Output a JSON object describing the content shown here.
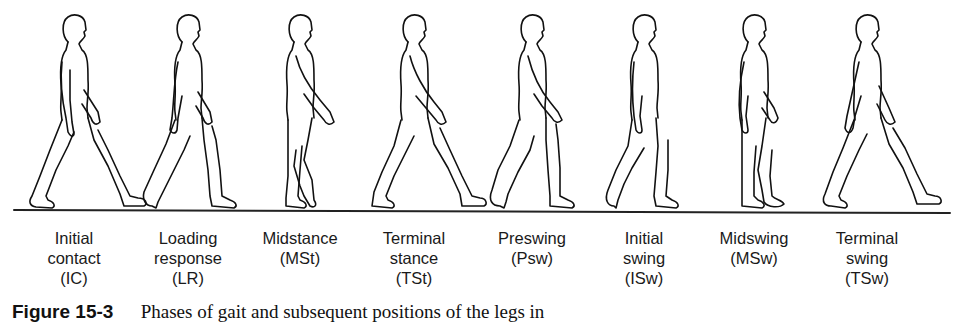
{
  "figure": {
    "number": "Figure 15-3",
    "caption": "Phases of gait and subsequent positions of the legs in",
    "ground_line": {
      "x1": 14,
      "y1": 210,
      "x2": 950,
      "y2": 213,
      "color": "#222222"
    },
    "stroke_color": "#111111",
    "phases": [
      {
        "name": "Initial contact",
        "line1": "Initial",
        "line2": "contact",
        "abbr": "(IC)",
        "x": 74
      },
      {
        "name": "Loading response",
        "line1": "Loading",
        "line2": "response",
        "abbr": "(LR)",
        "x": 188
      },
      {
        "name": "Midstance",
        "line1": "Midstance",
        "line2": "(MSt)",
        "abbr": "",
        "x": 300
      },
      {
        "name": "Terminal stance",
        "line1": "Terminal",
        "line2": "stance",
        "abbr": "(TSt)",
        "x": 414
      },
      {
        "name": "Preswing",
        "line1": "Preswing",
        "line2": "(Psw)",
        "abbr": "",
        "x": 532
      },
      {
        "name": "Initial swing",
        "line1": "Initial",
        "line2": "swing",
        "abbr": "(ISw)",
        "x": 644
      },
      {
        "name": "Midswing",
        "line1": "Midswing",
        "line2": "(MSw)",
        "abbr": "",
        "x": 754
      },
      {
        "name": "Terminal swing",
        "line1": "Terminal",
        "line2": "swing",
        "abbr": "(TSw)",
        "x": 867
      }
    ]
  }
}
